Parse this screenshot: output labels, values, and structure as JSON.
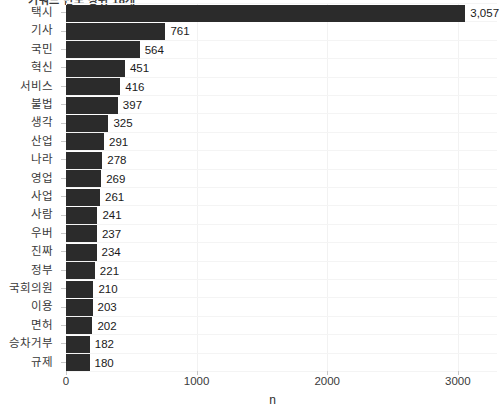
{
  "figure": {
    "clipped_title": "키워드 빈도 상위 18개",
    "background": "#ffffff",
    "bar_color": "#2b2b2b",
    "grid_color": "#f2f2f2"
  },
  "chart_data": {
    "type": "bar",
    "orientation": "horizontal",
    "title": "",
    "xlabel": "n",
    "ylabel": "",
    "xlim": [
      0,
      3300
    ],
    "grid": true,
    "legend": null,
    "xticks": [
      0,
      1000,
      2000,
      3000
    ],
    "xtick_labels": [
      "0",
      "1000",
      "2000",
      "3000"
    ],
    "categories": [
      "택시",
      "기사",
      "국민",
      "혁신",
      "서비스",
      "불법",
      "생각",
      "산업",
      "나라",
      "영업",
      "사업",
      "사람",
      "우버",
      "진짜",
      "정부",
      "국회의원",
      "이용",
      "면허",
      "승차거부",
      "규제"
    ],
    "values": [
      3057,
      761,
      564,
      451,
      416,
      397,
      325,
      291,
      278,
      269,
      261,
      241,
      237,
      234,
      221,
      210,
      203,
      202,
      182,
      180
    ],
    "value_labels": [
      "3,057",
      "761",
      "564",
      "451",
      "416",
      "397",
      "325",
      "291",
      "278",
      "269",
      "261",
      "241",
      "237",
      "234",
      "221",
      "210",
      "203",
      "202",
      "182",
      "180"
    ]
  }
}
